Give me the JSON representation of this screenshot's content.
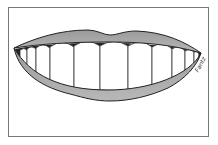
{
  "illustration": {
    "subject": "smiling mouth with upper and lower lips and a row of teeth",
    "signature": "Fantz",
    "colors": {
      "frame": "#777777",
      "lips": "#a8a8a8",
      "lip_outline": "#222222",
      "teeth": "#ffffff",
      "background": "#ffffff"
    }
  }
}
